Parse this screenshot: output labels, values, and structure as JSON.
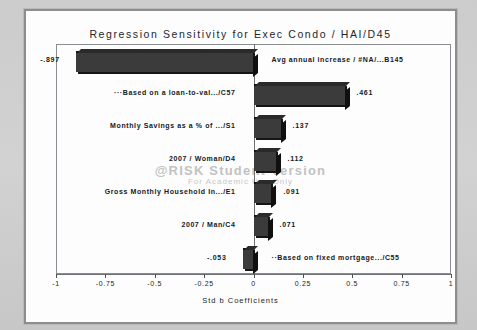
{
  "chart_data": {
    "type": "bar",
    "orientation": "horizontal",
    "title": "Regression Sensitivity for Exec Condo / HAI/D45",
    "xlabel": "Std b Coefficients",
    "ylabel": "",
    "xlim": [
      -1,
      1
    ],
    "grid": false,
    "legend": null,
    "xticks": [
      "-1",
      "-0.75",
      "-0.5",
      "-0.25",
      "0",
      "0.25",
      "0.5",
      "0.75",
      "1"
    ],
    "xtick_values": [
      -1,
      -0.75,
      -0.5,
      -0.25,
      0,
      0.25,
      0.5,
      0.75,
      1
    ],
    "categories": [
      "Avg annual increase / #NA/...B145",
      "···Based on a loan-to-val.../C57",
      "Monthly Savings as a % of .../S1",
      "2007 / Woman/D4",
      "Gross Monthly Household In.../E1",
      "2007 / Man/C4",
      "··Based on fixed mortgage.../C55"
    ],
    "values": [
      -0.897,
      0.461,
      0.137,
      0.112,
      0.091,
      0.071,
      -0.053
    ],
    "value_labels": [
      "-.897",
      ".461",
      ".137",
      ".112",
      ".091",
      ".071",
      "-.053"
    ],
    "bar_color": "#3b3b3b",
    "annotations": {
      "watermark_line1": "@RISK Student Version",
      "watermark_line2": "For Academic Use Only"
    }
  },
  "chart": {
    "title": "Regression Sensitivity for Exec Condo / HAI/D45",
    "xaxis_title": "Std b Coefficients",
    "ticks": [
      "-1",
      "-0.75",
      "-0.5",
      "-0.25",
      "0",
      "0.25",
      "0.5",
      "0.75",
      "1"
    ],
    "rows": [
      {
        "label": "Avg annual increase / #NA/...B145",
        "value_label": "-.897"
      },
      {
        "label": "···Based on a loan-to-val.../C57",
        "value_label": ".461"
      },
      {
        "label": "Monthly Savings as a % of .../S1",
        "value_label": ".137"
      },
      {
        "label": "2007 / Woman/D4",
        "value_label": ".112"
      },
      {
        "label": "Gross Monthly Household In.../E1",
        "value_label": ".091"
      },
      {
        "label": "2007 / Man/C4",
        "value_label": ".071"
      },
      {
        "label": "··Based on fixed mortgage.../C55",
        "value_label": "-.053"
      }
    ],
    "watermark": {
      "line1": "@RISK Student Version",
      "line2": "For Academic Use Only"
    }
  }
}
